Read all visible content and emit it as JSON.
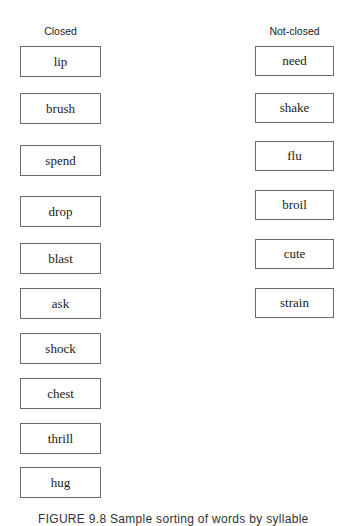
{
  "columns": {
    "closed": {
      "header": "Closed",
      "words": [
        "lip",
        "brush",
        "spend",
        "drop",
        "blast",
        "ask",
        "shock",
        "chest",
        "thrill",
        "hug"
      ]
    },
    "not_closed": {
      "header": "Not-closed",
      "words": [
        "need",
        "shake",
        "flu",
        "broil",
        "cute",
        "strain"
      ]
    }
  },
  "caption": "FIGURE 9.8 Sample sorting of words by syllable"
}
